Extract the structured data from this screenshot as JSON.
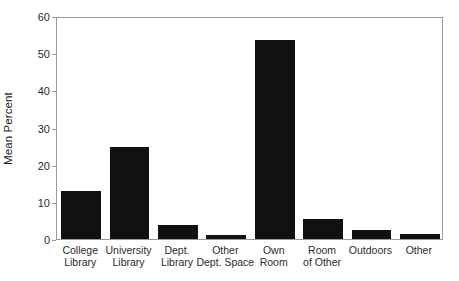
{
  "chart_data": {
    "type": "bar",
    "title": "",
    "xlabel": "",
    "ylabel": "Mean Percent",
    "ylim": [
      0,
      60
    ],
    "yticks": [
      0,
      10,
      20,
      30,
      40,
      50,
      60
    ],
    "grid": false,
    "legend": null,
    "bar_color": "#111111",
    "frame_color": "#9a9a9a",
    "categories": [
      "College Library",
      "University Library",
      "Dept. Library",
      "Other Dept. Space",
      "Own Room",
      "Room of Other",
      "Outdoors",
      "Other"
    ],
    "category_lines": [
      [
        "College",
        "Library"
      ],
      [
        "University",
        "Library"
      ],
      [
        "Dept.",
        "Library"
      ],
      [
        "Other",
        "Dept. Space"
      ],
      [
        "Own",
        "Room"
      ],
      [
        "Room",
        "of Other"
      ],
      [
        "Outdoors",
        ""
      ],
      [
        "Other",
        ""
      ]
    ],
    "values": [
      12.8,
      24.8,
      3.7,
      1.0,
      53.5,
      5.3,
      2.5,
      1.3
    ]
  }
}
